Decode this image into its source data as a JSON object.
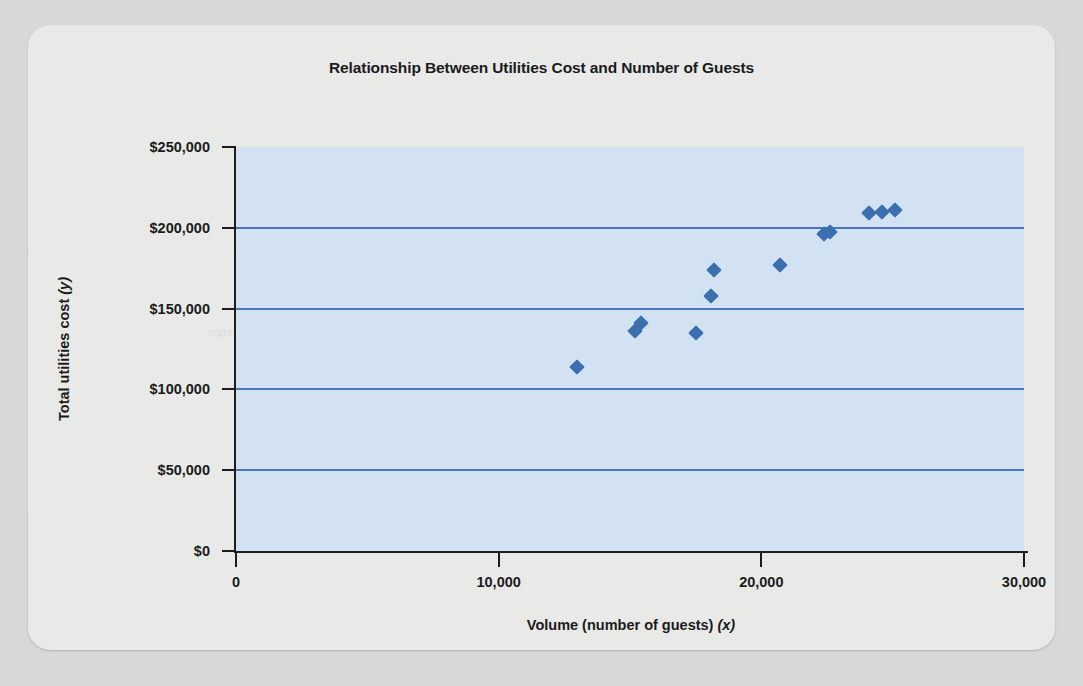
{
  "chart_data": {
    "type": "scatter",
    "title": "Relationship Between Utilities Cost and Number of Guests",
    "xlabel": "Volume (number of guests)",
    "xlabel_var": "(x)",
    "ylabel": "Total utilities cost",
    "ylabel_var": "(y)",
    "xlim": [
      0,
      30000
    ],
    "ylim": [
      0,
      250000
    ],
    "grid": "horizontal",
    "legend": "none",
    "x_ticks": [
      0,
      10000,
      20000,
      30000
    ],
    "x_tick_labels": [
      "0",
      "10,000",
      "20,000",
      "30,000"
    ],
    "y_ticks": [
      0,
      50000,
      100000,
      150000,
      200000,
      250000
    ],
    "y_tick_labels": [
      "$0",
      "$50,000",
      "$100,000",
      "$150,000",
      "$200,000",
      "$250,000"
    ],
    "gridline_values": [
      50000,
      100000,
      150000,
      200000
    ],
    "marker": "diamond",
    "marker_color": "#3b6fb0",
    "plot_background_color": "#d3e2f3",
    "gridline_color": "#4878be",
    "points": [
      {
        "x": 13000,
        "y": 114000
      },
      {
        "x": 15200,
        "y": 136000
      },
      {
        "x": 15400,
        "y": 141000
      },
      {
        "x": 17500,
        "y": 135000
      },
      {
        "x": 18100,
        "y": 158000
      },
      {
        "x": 18200,
        "y": 174000
      },
      {
        "x": 20700,
        "y": 177000
      },
      {
        "x": 22400,
        "y": 196000
      },
      {
        "x": 22600,
        "y": 197500
      },
      {
        "x": 24100,
        "y": 209000
      },
      {
        "x": 24600,
        "y": 210000
      },
      {
        "x": 25100,
        "y": 211000
      }
    ]
  },
  "bleed_text": [
    {
      "left": 250,
      "top": 200,
      "text": "the cost of the facility and the number of guests served"
    },
    {
      "left": 300,
      "top": 222,
      "text": "a scatter diagram and the high-low method"
    },
    {
      "left": 285,
      "top": 244,
      "text": "estimate the variable and fixed components"
    },
    {
      "left": 180,
      "top": 300,
      "text": "regression analysis provides a statistical"
    },
    {
      "left": 220,
      "top": 480,
      "text": "the relationship between volume and total cost"
    },
    {
      "left": 640,
      "top": 190,
      "text": "cost behavior patterns within the relevant range"
    }
  ]
}
